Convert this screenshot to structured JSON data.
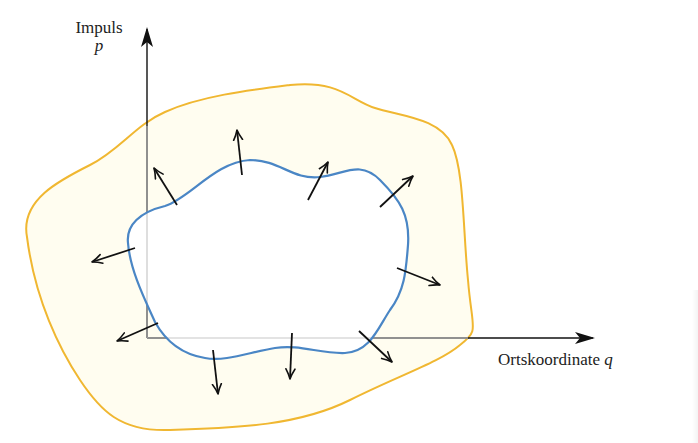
{
  "diagram": {
    "type": "phase-space",
    "axes": {
      "vertical": {
        "label": "Impuls",
        "variable": "p"
      },
      "horizontal": {
        "label": "Ortskoordinate",
        "variable": "q"
      }
    },
    "regions": [
      {
        "name": "outer-region",
        "stroke_color": "#f0b731",
        "fill_color": "#fffdf0"
      },
      {
        "name": "inner-region",
        "stroke_color": "#4a86c5",
        "fill_color": "#ffffff"
      }
    ],
    "colors": {
      "axis": "#111111",
      "axis_inside": "#a9a9a9",
      "arrow": "#111111",
      "text": "#222222"
    },
    "normal_arrow_count": 11
  }
}
